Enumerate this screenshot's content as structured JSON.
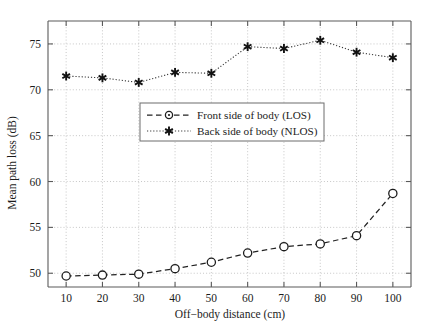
{
  "chart_data": {
    "type": "line",
    "title": "",
    "subtitle": "",
    "xlabel": "Off−body distance (cm)",
    "ylabel": "Mean path loss (dB)",
    "x": [
      10,
      20,
      30,
      40,
      50,
      60,
      70,
      80,
      90,
      100
    ],
    "xticklabels": [
      "10",
      "20",
      "30",
      "40",
      "50",
      "60",
      "70",
      "80",
      "90",
      "100"
    ],
    "yticklabels": [
      "50",
      "55",
      "60",
      "65",
      "70",
      "75"
    ],
    "yticks": [
      50,
      55,
      60,
      65,
      70,
      75
    ],
    "xlim": [
      5,
      105
    ],
    "ylim": [
      48.5,
      77.5
    ],
    "grid": true,
    "legend_position": "center",
    "series": [
      {
        "name": "Front side of body (LOS)",
        "marker": "circle-open",
        "linestyle": "dashed",
        "color": "#222222",
        "values": [
          49.7,
          49.8,
          49.9,
          50.5,
          51.2,
          52.2,
          52.9,
          53.2,
          54.1,
          58.7
        ]
      },
      {
        "name": "Back side of body (NLOS)",
        "marker": "star",
        "linestyle": "dotted",
        "color": "#121212",
        "values": [
          71.5,
          71.3,
          70.8,
          71.9,
          71.8,
          74.7,
          74.5,
          75.4,
          74.1,
          73.5
        ]
      }
    ]
  },
  "legend": {
    "entries": [
      {
        "label": "Front side of body (LOS)"
      },
      {
        "label": "Back side of body (NLOS)"
      }
    ]
  },
  "axes": {
    "x_title": "Off−body distance (cm)",
    "y_title": "Mean path loss (dB)"
  },
  "colors": {
    "series_los": "#222222",
    "series_nlos": "#121212",
    "grid": "#b9b9b9",
    "spine": "#5a5a5a",
    "background": "#ffffff"
  }
}
